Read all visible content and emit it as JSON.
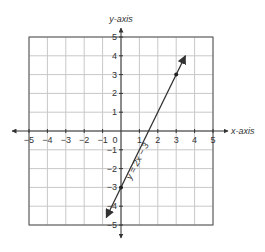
{
  "chart_data": {
    "type": "line",
    "title": "",
    "xlabel": "x-axis",
    "ylabel": "y-axis",
    "xlim": [
      -5,
      5
    ],
    "ylim": [
      -5,
      5
    ],
    "grid": true,
    "x_ticks": [
      -5,
      -4,
      -3,
      -2,
      -1,
      0,
      1,
      2,
      3,
      4,
      5
    ],
    "x_tick_labels": [
      "−5",
      "−4",
      "−3",
      "−2",
      "−1",
      "0",
      "1",
      "2",
      "3",
      "4",
      "5"
    ],
    "y_ticks": [
      5,
      4,
      3,
      2,
      1,
      -1,
      -2,
      -3,
      -4,
      -5
    ],
    "y_tick_labels": [
      "5",
      "4",
      "3",
      "2",
      "1",
      "−1",
      "−2",
      "−3",
      "−4",
      "−5"
    ],
    "series": [
      {
        "name": "y = 2x − 3",
        "equation": "y = 2x - 3",
        "slope": 2,
        "intercept": -3,
        "x": [
          -0.8,
          3.5
        ],
        "y": [
          -4.6,
          4.0
        ],
        "marked_points": [
          [
            0,
            -3
          ],
          [
            3,
            3
          ]
        ],
        "arrows_both_ends": true
      }
    ],
    "annotations": [
      {
        "text": "y = 2x − 3",
        "rotation_deg": -63
      }
    ]
  },
  "labels": {
    "x_axis": "x-axis",
    "y_axis": "y-axis",
    "line_label": "y = 2x − 3"
  },
  "colors": {
    "grid": "#c8c8c8",
    "border": "#555555",
    "axis": "#333333",
    "line": "#333333"
  }
}
